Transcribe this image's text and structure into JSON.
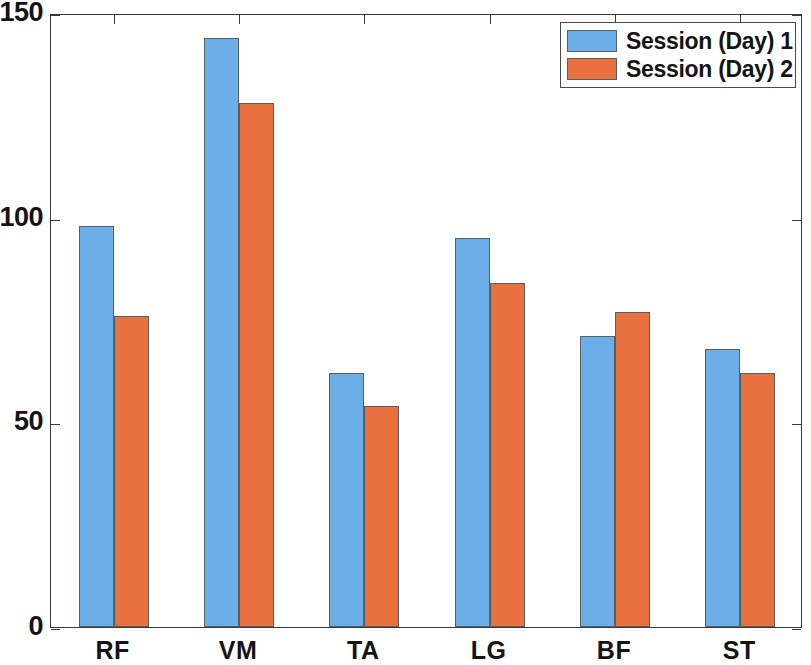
{
  "chart_data": {
    "type": "bar",
    "title": "",
    "subtitle": "",
    "xlabel": "",
    "ylabel": "",
    "categories": [
      "RF",
      "VM",
      "TA",
      "LG",
      "BF",
      "ST"
    ],
    "series": [
      {
        "name": "Session (Day) 1",
        "color": "#6BAEE8",
        "values": [
          98,
          144,
          62,
          95,
          71,
          68
        ]
      },
      {
        "name": "Session (Day) 2",
        "color": "#E8713F",
        "values": [
          76,
          128,
          54,
          84,
          77,
          62
        ]
      }
    ],
    "ylim": [
      0,
      150
    ],
    "yticks": [
      0,
      50,
      100,
      150
    ],
    "ytick_labels": [
      "0",
      "50",
      "100",
      "150"
    ],
    "grid": false,
    "legend_position": "top-right",
    "bar_edge_color": "#555F66",
    "axis_color": "#3A3A3A",
    "background_color": "#FFFFFF"
  },
  "legend": {
    "entries": [
      {
        "label": "Session (Day) 1"
      },
      {
        "label": "Session (Day) 2"
      }
    ]
  }
}
